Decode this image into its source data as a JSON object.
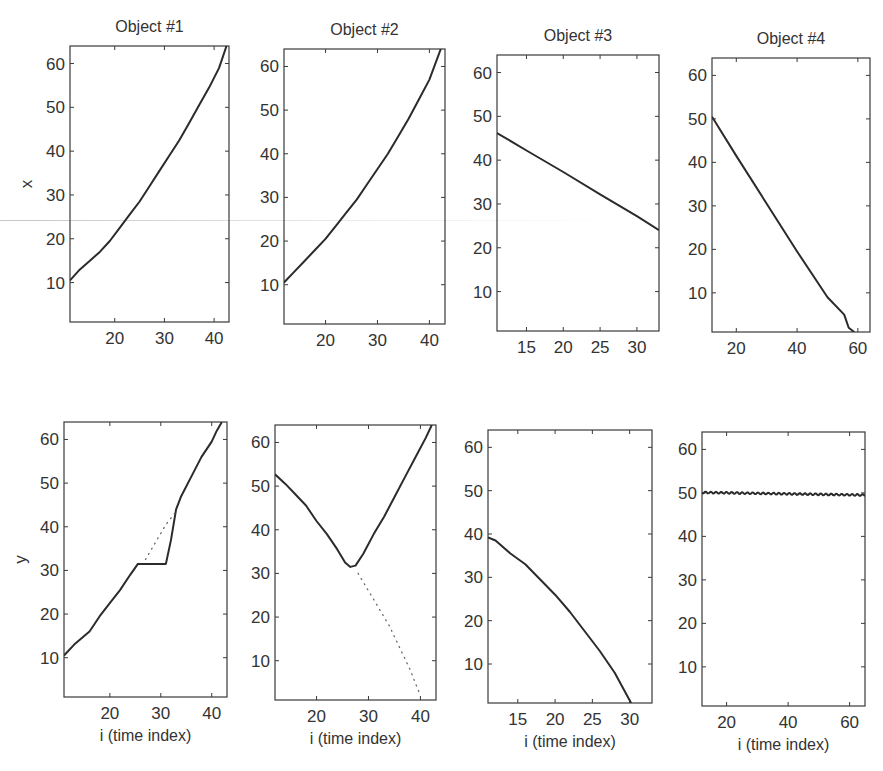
{
  "figure": {
    "row_labels": [
      "x",
      "y"
    ],
    "xlabel": "i (time index)"
  },
  "chart_data": [
    {
      "type": "line",
      "panel": 1,
      "row": 1,
      "col": 1,
      "title": "Object #1",
      "xlabel": "",
      "ylabel": "x",
      "xlim": [
        11,
        43
      ],
      "ylim": [
        1,
        64
      ],
      "xticks": [
        20,
        30,
        40
      ],
      "yticks": [
        10,
        20,
        30,
        40,
        50,
        60
      ],
      "grid": false,
      "series": [
        {
          "name": "x trajectory",
          "style": "solid",
          "x": [
            11,
            13,
            15,
            17,
            19,
            21,
            23,
            25,
            27,
            29,
            31,
            33,
            35,
            37,
            39,
            41,
            42.5
          ],
          "y": [
            10.5,
            13,
            15,
            17,
            19.5,
            22.5,
            25.5,
            28.5,
            32,
            35.5,
            39,
            42.5,
            46.5,
            50.5,
            54.5,
            59,
            64
          ]
        }
      ]
    },
    {
      "type": "line",
      "panel": 2,
      "row": 1,
      "col": 2,
      "title": "Object #2",
      "xlabel": "",
      "ylabel": "",
      "xlim": [
        12,
        43
      ],
      "ylim": [
        1,
        64
      ],
      "xticks": [
        20,
        30,
        40
      ],
      "yticks": [
        10,
        20,
        30,
        40,
        50,
        60
      ],
      "grid": false,
      "series": [
        {
          "name": "x trajectory",
          "style": "solid",
          "x": [
            12,
            14,
            16,
            18,
            20,
            22,
            24,
            26,
            28,
            30,
            32,
            34,
            36,
            38,
            40,
            42.2
          ],
          "y": [
            10.5,
            13,
            15.5,
            18,
            20.5,
            23.5,
            26.5,
            29.5,
            33,
            36.5,
            40,
            44,
            48,
            52.5,
            57,
            64
          ]
        }
      ]
    },
    {
      "type": "line",
      "panel": 3,
      "row": 1,
      "col": 3,
      "title": "Object #3",
      "xlabel": "",
      "ylabel": "",
      "xlim": [
        11,
        33
      ],
      "ylim": [
        1,
        64
      ],
      "xticks": [
        15,
        20,
        25,
        30
      ],
      "yticks": [
        10,
        20,
        30,
        40,
        50,
        60
      ],
      "grid": false,
      "series": [
        {
          "name": "x trajectory",
          "style": "solid",
          "x": [
            11,
            15,
            20,
            25,
            30,
            33
          ],
          "y": [
            46.2,
            42.2,
            37.3,
            32.2,
            27.2,
            24
          ]
        }
      ]
    },
    {
      "type": "line",
      "panel": 4,
      "row": 1,
      "col": 4,
      "title": "Object #4",
      "xlabel": "",
      "ylabel": "",
      "xlim": [
        12,
        64
      ],
      "ylim": [
        1,
        64
      ],
      "xticks": [
        20,
        40,
        60
      ],
      "yticks": [
        10,
        20,
        30,
        40,
        50,
        60
      ],
      "grid": false,
      "series": [
        {
          "name": "x trajectory",
          "style": "solid",
          "x": [
            12,
            20,
            30,
            40,
            50,
            55.5,
            57,
            58.8
          ],
          "y": [
            50.5,
            41.5,
            30.5,
            19.5,
            9,
            5,
            2,
            1
          ]
        }
      ]
    },
    {
      "type": "line",
      "panel": 5,
      "row": 2,
      "col": 1,
      "title": "",
      "xlabel": "i (time index)",
      "ylabel": "y",
      "xlim": [
        11,
        43
      ],
      "ylim": [
        1,
        64
      ],
      "xticks": [
        20,
        30,
        40
      ],
      "yticks": [
        10,
        20,
        30,
        40,
        50,
        60
      ],
      "grid": false,
      "series": [
        {
          "name": "y trajectory",
          "style": "solid",
          "x": [
            11,
            13,
            16,
            18,
            20,
            22,
            24,
            25.5,
            26.5,
            31,
            32,
            33,
            34,
            36,
            38,
            40,
            41,
            42
          ],
          "y": [
            10.5,
            13,
            16,
            19.5,
            22.5,
            25.5,
            29,
            31.5,
            31.5,
            31.5,
            37,
            44,
            47,
            51.5,
            56,
            59.5,
            62,
            64
          ]
        },
        {
          "name": "prediction",
          "style": "dotted",
          "x": [
            27,
            28,
            29,
            30,
            31,
            32,
            33
          ],
          "y": [
            32.5,
            34.5,
            36.5,
            38.5,
            40.5,
            42,
            43.5
          ]
        }
      ]
    },
    {
      "type": "line",
      "panel": 6,
      "row": 2,
      "col": 2,
      "title": "",
      "xlabel": "i (time index)",
      "ylabel": "",
      "xlim": [
        12,
        43
      ],
      "ylim": [
        1,
        64
      ],
      "xticks": [
        20,
        30,
        40
      ],
      "yticks": [
        10,
        20,
        30,
        40,
        50,
        60
      ],
      "grid": false,
      "series": [
        {
          "name": "y trajectory",
          "style": "solid",
          "x": [
            12,
            14,
            16,
            18,
            20,
            22,
            24,
            25.5,
            26.5,
            27.5,
            29,
            31,
            33,
            35,
            37,
            39,
            41,
            42.2
          ],
          "y": [
            52.7,
            50.5,
            48,
            45.5,
            42,
            39,
            35.5,
            32.5,
            31.5,
            31.8,
            34.5,
            39,
            43,
            47.5,
            52,
            56.5,
            61,
            64
          ]
        },
        {
          "name": "prediction",
          "style": "dotted",
          "x": [
            28,
            30,
            32,
            34,
            36,
            38,
            40
          ],
          "y": [
            30,
            26,
            22,
            18,
            13,
            8,
            2
          ]
        }
      ]
    },
    {
      "type": "line",
      "panel": 7,
      "row": 2,
      "col": 3,
      "title": "",
      "xlabel": "i (time index)",
      "ylabel": "",
      "xlim": [
        11,
        33
      ],
      "ylim": [
        1,
        64
      ],
      "xticks": [
        15,
        20,
        25,
        30
      ],
      "yticks": [
        10,
        20,
        30,
        40,
        50,
        60
      ],
      "grid": false,
      "series": [
        {
          "name": "y trajectory",
          "style": "solid",
          "x": [
            11,
            12,
            14,
            16,
            18,
            20,
            22,
            24,
            26,
            28,
            30.2
          ],
          "y": [
            39.2,
            38.5,
            35.5,
            33,
            29.5,
            26,
            22,
            17.5,
            13,
            8,
            1
          ]
        }
      ]
    },
    {
      "type": "line",
      "panel": 8,
      "row": 2,
      "col": 4,
      "title": "",
      "xlabel": "i (time index)",
      "ylabel": "",
      "xlim": [
        12,
        65
      ],
      "ylim": [
        1,
        64
      ],
      "xticks": [
        20,
        40,
        60
      ],
      "yticks": [
        10,
        20,
        30,
        40,
        50,
        60
      ],
      "grid": false,
      "series": [
        {
          "name": "y trajectory",
          "style": "solid-wavy",
          "x": [
            12,
            20,
            30,
            40,
            50,
            60,
            65
          ],
          "y": [
            50.1,
            50.0,
            49.9,
            49.8,
            49.7,
            49.6,
            49.5
          ]
        }
      ]
    }
  ],
  "layout": {
    "frames": [
      {
        "l": 70,
        "t": 46,
        "r": 229,
        "b": 322
      },
      {
        "l": 284,
        "t": 49,
        "r": 445,
        "b": 324
      },
      {
        "l": 497,
        "t": 55,
        "r": 659,
        "b": 331
      },
      {
        "l": 712,
        "t": 58,
        "r": 870,
        "b": 332
      },
      {
        "l": 64,
        "t": 422,
        "r": 227,
        "b": 697
      },
      {
        "l": 275,
        "t": 425,
        "r": 436,
        "b": 700
      },
      {
        "l": 488,
        "t": 430,
        "r": 652,
        "b": 703
      },
      {
        "l": 702,
        "t": 432,
        "r": 865,
        "b": 706
      }
    ],
    "line_color": "#2b2b2b",
    "axis_color": "#3a3a3a"
  }
}
